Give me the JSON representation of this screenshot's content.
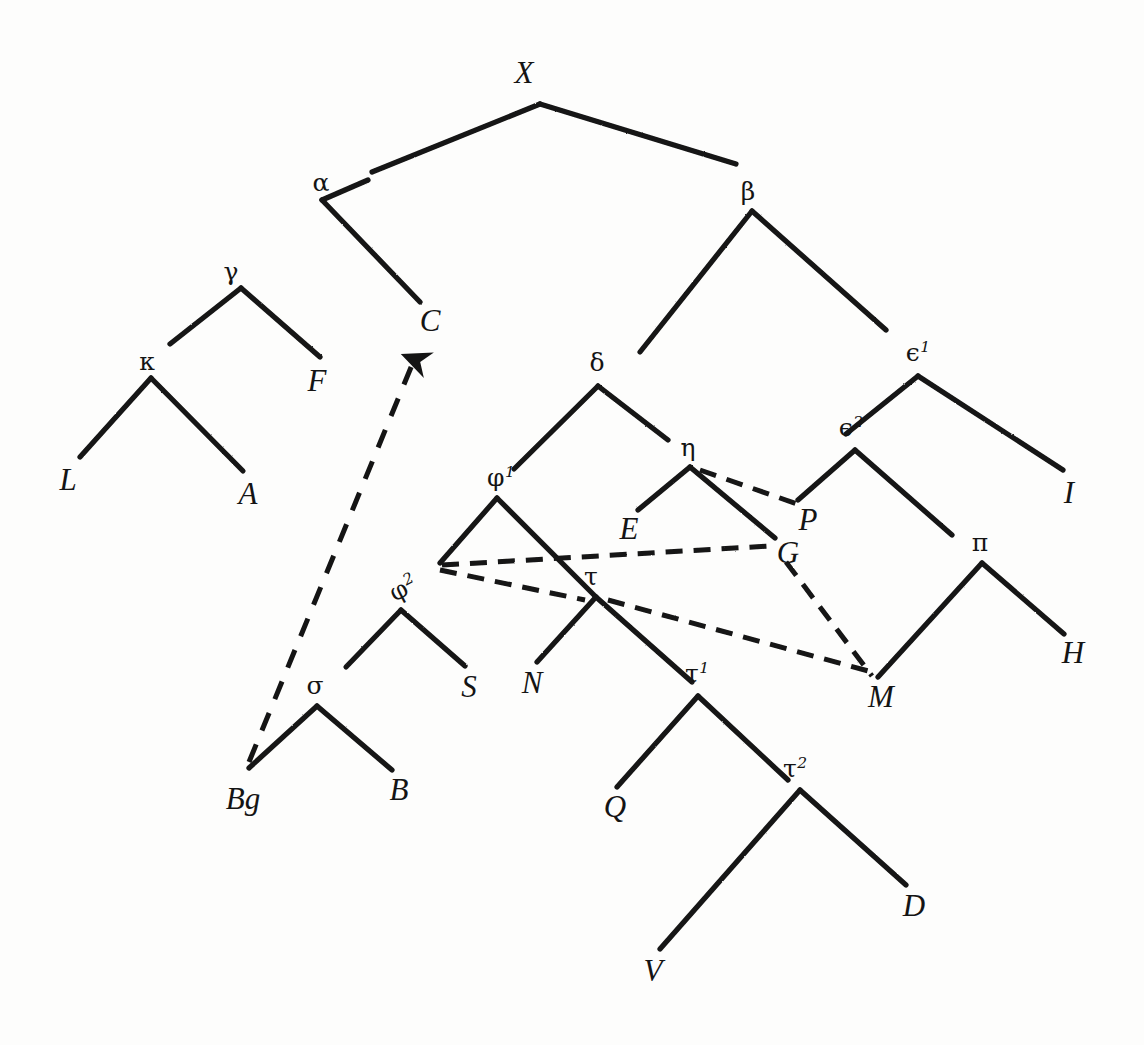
{
  "diagram": {
    "type": "manuscript-stemma-tree",
    "background_color": "#fdfdfc",
    "ink_color": "#1a1a1a",
    "root": "X",
    "nodes": [
      {
        "id": "X",
        "label": "X",
        "sup": "",
        "kind": "archetype",
        "x": 524,
        "y": 72,
        "apex_x": 540,
        "apex_y": 104
      },
      {
        "id": "alpha",
        "label": "α",
        "sup": "",
        "kind": "hyparchetype",
        "x": 321,
        "y": 182,
        "apex_x": 322,
        "apex_y": 200
      },
      {
        "id": "beta",
        "label": "β",
        "sup": "",
        "kind": "hyparchetype",
        "x": 748,
        "y": 191,
        "apex_x": 752,
        "apex_y": 211
      },
      {
        "id": "gamma",
        "label": "γ",
        "sup": "",
        "kind": "hyparchetype",
        "x": 231,
        "y": 271,
        "apex_x": 241,
        "apex_y": 288
      },
      {
        "id": "C",
        "label": "C",
        "sup": "",
        "kind": "witness",
        "x": 430,
        "y": 320,
        "apex_x": 420,
        "apex_y": 302
      },
      {
        "id": "kappa",
        "label": "κ",
        "sup": "",
        "kind": "hyparchetype",
        "x": 147,
        "y": 361,
        "apex_x": 151,
        "apex_y": 378
      },
      {
        "id": "F",
        "label": "F",
        "sup": "",
        "kind": "witness",
        "x": 317,
        "y": 380,
        "apex_x": 320,
        "apex_y": 357
      },
      {
        "id": "delta",
        "label": "δ",
        "sup": "",
        "kind": "hyparchetype",
        "x": 597,
        "y": 362,
        "apex_x": 598,
        "apex_y": 386
      },
      {
        "id": "eps1",
        "label": "ϵ",
        "sup": "1",
        "kind": "hyparchetype",
        "x": 918,
        "y": 352,
        "apex_x": 918,
        "apex_y": 376
      },
      {
        "id": "eps2",
        "label": "ϵ",
        "sup": "2",
        "kind": "hyparchetype",
        "x": 851,
        "y": 427,
        "apex_x": 855,
        "apex_y": 450
      },
      {
        "id": "L",
        "label": "L",
        "sup": "",
        "kind": "witness",
        "x": 68,
        "y": 479,
        "apex_x": 80,
        "apex_y": 457
      },
      {
        "id": "A",
        "label": "A",
        "sup": "",
        "kind": "witness",
        "x": 248,
        "y": 493,
        "apex_x": 243,
        "apex_y": 471
      },
      {
        "id": "eta",
        "label": "η",
        "sup": "",
        "kind": "hyparchetype",
        "x": 688,
        "y": 447,
        "apex_x": 690,
        "apex_y": 467
      },
      {
        "id": "phi1",
        "label": "φ",
        "sup": "1",
        "kind": "hyparchetype",
        "x": 501,
        "y": 477,
        "apex_x": 497,
        "apex_y": 498
      },
      {
        "id": "I",
        "label": "I",
        "sup": "",
        "kind": "witness",
        "x": 1069,
        "y": 492,
        "apex_x": 1063,
        "apex_y": 470
      },
      {
        "id": "E",
        "label": "E",
        "sup": "",
        "kind": "witness",
        "x": 629,
        "y": 528,
        "apex_x": 638,
        "apex_y": 510
      },
      {
        "id": "P",
        "label": "P",
        "sup": "",
        "kind": "witness",
        "x": 808,
        "y": 519,
        "apex_x": 802,
        "apex_y": 500
      },
      {
        "id": "G",
        "label": "G",
        "sup": "",
        "kind": "witness",
        "x": 788,
        "y": 552,
        "apex_x": 775,
        "apex_y": 538
      },
      {
        "id": "pi",
        "label": "π",
        "sup": "",
        "kind": "hyparchetype",
        "x": 980,
        "y": 542,
        "apex_x": 982,
        "apex_y": 563
      },
      {
        "id": "phi2",
        "label": "φ",
        "sup": "2",
        "kind": "hyparchetype",
        "x": 403,
        "y": 588,
        "apex_x": 401,
        "apex_y": 610,
        "rotated": true
      },
      {
        "id": "tau",
        "label": "τ",
        "sup": "",
        "kind": "hyparchetype",
        "x": 591,
        "y": 576,
        "apex_x": 596,
        "apex_y": 597
      },
      {
        "id": "H",
        "label": "H",
        "sup": "",
        "kind": "witness",
        "x": 1073,
        "y": 652,
        "apex_x": 1064,
        "apex_y": 634
      },
      {
        "id": "S",
        "label": "S",
        "sup": "",
        "kind": "witness",
        "x": 469,
        "y": 686,
        "apex_x": 465,
        "apex_y": 666
      },
      {
        "id": "N",
        "label": "N",
        "sup": "",
        "kind": "witness",
        "x": 532,
        "y": 682,
        "apex_x": 537,
        "apex_y": 662
      },
      {
        "id": "tau1",
        "label": "τ",
        "sup": "1",
        "kind": "hyparchetype",
        "x": 697,
        "y": 673,
        "apex_x": 698,
        "apex_y": 696
      },
      {
        "id": "M",
        "label": "M",
        "sup": "",
        "kind": "witness",
        "x": 881,
        "y": 696,
        "apex_x": 878,
        "apex_y": 677
      },
      {
        "id": "sigma",
        "label": "σ",
        "sup": "",
        "kind": "hyparchetype",
        "x": 315,
        "y": 685,
        "apex_x": 317,
        "apex_y": 706
      },
      {
        "id": "Bg",
        "label": "Bg",
        "sup": "",
        "kind": "witness",
        "x": 243,
        "y": 798,
        "apex_x": 249,
        "apex_y": 768
      },
      {
        "id": "B",
        "label": "B",
        "sup": "",
        "kind": "witness",
        "x": 399,
        "y": 789,
        "apex_x": 392,
        "apex_y": 770
      },
      {
        "id": "tau2",
        "label": "τ",
        "sup": "2",
        "kind": "hyparchetype",
        "x": 795,
        "y": 768,
        "apex_x": 800,
        "apex_y": 790
      },
      {
        "id": "Q",
        "label": "Q",
        "sup": "",
        "kind": "witness",
        "x": 615,
        "y": 806,
        "apex_x": 617,
        "apex_y": 787
      },
      {
        "id": "D",
        "label": "D",
        "sup": "",
        "kind": "witness",
        "x": 914,
        "y": 905,
        "apex_x": 906,
        "apex_y": 885
      },
      {
        "id": "V",
        "label": "V",
        "sup": "",
        "kind": "witness",
        "x": 653,
        "y": 970,
        "apex_x": 660,
        "apex_y": 949
      }
    ],
    "edges": [
      {
        "from": "X",
        "to": "alpha",
        "style": "solid"
      },
      {
        "from": "X",
        "to": "beta",
        "style": "solid"
      },
      {
        "from": "alpha",
        "to": "gamma",
        "style": "solid"
      },
      {
        "from": "alpha",
        "to": "C",
        "style": "solid"
      },
      {
        "from": "gamma",
        "to": "kappa",
        "style": "solid"
      },
      {
        "from": "gamma",
        "to": "F",
        "style": "solid"
      },
      {
        "from": "kappa",
        "to": "L",
        "style": "solid"
      },
      {
        "from": "kappa",
        "to": "A",
        "style": "solid"
      },
      {
        "from": "beta",
        "to": "delta",
        "style": "solid"
      },
      {
        "from": "beta",
        "to": "eps1",
        "style": "solid"
      },
      {
        "from": "delta",
        "to": "phi1",
        "style": "solid"
      },
      {
        "from": "delta",
        "to": "eta",
        "style": "solid"
      },
      {
        "from": "eta",
        "to": "E",
        "style": "solid"
      },
      {
        "from": "eta",
        "to": "G",
        "style": "solid"
      },
      {
        "from": "eps1",
        "to": "eps2",
        "style": "solid"
      },
      {
        "from": "eps1",
        "to": "I",
        "style": "solid"
      },
      {
        "from": "eps2",
        "to": "P",
        "style": "solid"
      },
      {
        "from": "eps2",
        "to": "pi",
        "style": "solid"
      },
      {
        "from": "pi",
        "to": "M",
        "style": "solid"
      },
      {
        "from": "pi",
        "to": "H",
        "style": "solid"
      },
      {
        "from": "phi1",
        "to": "phi2",
        "style": "solid"
      },
      {
        "from": "phi1",
        "to": "tau",
        "style": "solid"
      },
      {
        "from": "phi2",
        "to": "sigma",
        "style": "solid"
      },
      {
        "from": "phi2",
        "to": "S",
        "style": "solid"
      },
      {
        "from": "sigma",
        "to": "Bg",
        "style": "solid"
      },
      {
        "from": "sigma",
        "to": "B",
        "style": "solid"
      },
      {
        "from": "tau",
        "to": "N",
        "style": "solid"
      },
      {
        "from": "tau",
        "to": "tau1",
        "style": "solid"
      },
      {
        "from": "tau1",
        "to": "Q",
        "style": "solid"
      },
      {
        "from": "tau1",
        "to": "tau2",
        "style": "solid"
      },
      {
        "from": "tau2",
        "to": "V",
        "style": "solid"
      },
      {
        "from": "tau2",
        "to": "D",
        "style": "solid"
      },
      {
        "from": "eta",
        "to": "P",
        "style": "dashed"
      },
      {
        "from": "phi1",
        "to": "G",
        "style": "dashed"
      },
      {
        "from": "phi1",
        "to": "tau",
        "style": "dashed"
      },
      {
        "from": "tau",
        "to": "M",
        "style": "dashed"
      },
      {
        "from": "G",
        "to": "M",
        "style": "dashed"
      },
      {
        "from": "Bg",
        "to": "C",
        "style": "dashed-arrow"
      }
    ],
    "paths": {
      "solid": [
        "M540,104 L372,172",
        "M540,104 L736,164",
        "M322,200 L368,180",
        "M322,200 L420,302",
        "M241,288 L170,344",
        "M241,288 L320,357",
        "M151,378 L80,457",
        "M151,378 L243,471",
        "M752,211 L640,352",
        "M752,211 L886,330",
        "M598,386 L514,469",
        "M598,386 L668,440",
        "M690,467 L638,510",
        "M690,467 L775,538",
        "M918,376 L846,434",
        "M918,376 L1063,470",
        "M855,450 L798,500",
        "M855,450 L952,535",
        "M982,563 L878,677",
        "M982,563 L1064,634",
        "M497,498 L440,563",
        "M497,498 L596,597",
        "M401,610 L346,667",
        "M401,610 L465,666",
        "M317,706 L249,768",
        "M317,706 L392,770",
        "M596,597 L537,662",
        "M596,597 L692,682",
        "M698,696 L617,787",
        "M698,696 L788,780",
        "M800,790 L660,949",
        "M800,790 L906,885"
      ],
      "dashed": [
        "M700,470 L800,505",
        "M442,565 L770,546",
        "M440,570 L585,600",
        "M608,600 L872,672",
        "M786,562 L872,676"
      ],
      "dashed_arrow": "M249,762 L414,360"
    }
  }
}
